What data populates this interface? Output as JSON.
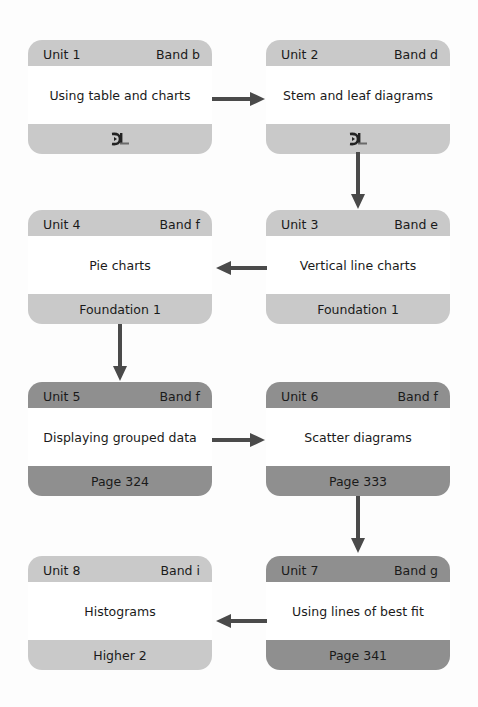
{
  "colors": {
    "background": "#fdfdfd",
    "card_light": "#c9c9c9",
    "card_dark": "#8f8f8f",
    "card_body": "#ffffff",
    "arrow": "#4a4a4a"
  },
  "units": [
    {
      "unit": "Unit 1",
      "band": "Band b",
      "title": "Using table and charts",
      "footer": "",
      "footer_icon": "dl-logo-icon",
      "style": "light"
    },
    {
      "unit": "Unit 2",
      "band": "Band d",
      "title": "Stem and leaf diagrams",
      "footer": "",
      "footer_icon": "dl-logo-icon",
      "style": "light"
    },
    {
      "unit": "Unit 3",
      "band": "Band e",
      "title": "Vertical line charts",
      "footer": "Foundation 1",
      "style": "light"
    },
    {
      "unit": "Unit 4",
      "band": "Band f",
      "title": "Pie charts",
      "footer": "Foundation 1",
      "style": "light"
    },
    {
      "unit": "Unit 5",
      "band": "Band f",
      "title": "Displaying grouped data",
      "footer": "Page 324",
      "style": "dark"
    },
    {
      "unit": "Unit 6",
      "band": "Band f",
      "title": "Scatter diagrams",
      "footer": "Page 333",
      "style": "dark"
    },
    {
      "unit": "Unit 7",
      "band": "Band g",
      "title": "Using lines of best fit",
      "footer": "Page 341",
      "style": "dark"
    },
    {
      "unit": "Unit 8",
      "band": "Band i",
      "title": "Histograms",
      "footer": "Higher 2",
      "style": "light"
    }
  ],
  "flow": [
    {
      "from": "Unit 1",
      "to": "Unit 2",
      "direction": "right"
    },
    {
      "from": "Unit 2",
      "to": "Unit 3",
      "direction": "down"
    },
    {
      "from": "Unit 3",
      "to": "Unit 4",
      "direction": "left"
    },
    {
      "from": "Unit 4",
      "to": "Unit 5",
      "direction": "down"
    },
    {
      "from": "Unit 5",
      "to": "Unit 6",
      "direction": "right"
    },
    {
      "from": "Unit 6",
      "to": "Unit 7",
      "direction": "down"
    },
    {
      "from": "Unit 7",
      "to": "Unit 8",
      "direction": "left"
    }
  ]
}
